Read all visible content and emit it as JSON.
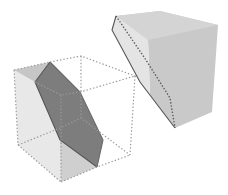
{
  "figure": {
    "colors": {
      "background": "#ffffff",
      "cube_face_light": "#e6e6e6",
      "cube_face_mid": "#d2d2d2",
      "cube_face_top": "#c4c4c4",
      "section": "#7d7d7d",
      "section_edge": "#4a4a4a",
      "piece_main": "#c9c9c9",
      "piece_side": "#e2e2e2",
      "piece_top": "#d6d6d6",
      "dotted_edge": "#9a9a9a"
    },
    "labels": []
  }
}
